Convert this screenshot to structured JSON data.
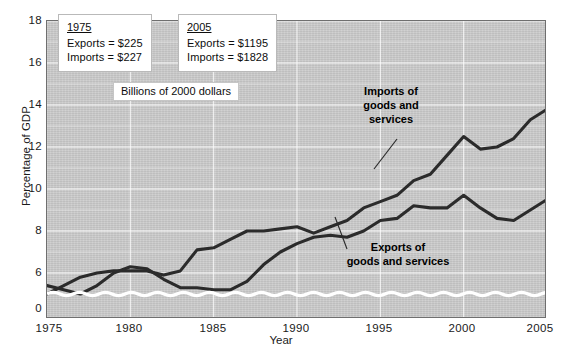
{
  "chart_data": {
    "type": "line",
    "title": "",
    "xlabel": "Year",
    "ylabel": "Percentage of GDP",
    "xlim": [
      1975,
      2005
    ],
    "ylim": [
      5.0,
      18.0
    ],
    "y_axis_break": true,
    "y_break_below": 5.0,
    "grid": true,
    "grid_color": "#ffffff",
    "plot_background": "#cdcdcd",
    "line_color": "#2b2b2b",
    "legend": "inline-annotations",
    "xticks": [
      "1975",
      "1980",
      "1985",
      "1990",
      "1995",
      "2000",
      "2005"
    ],
    "yticks": [
      "0",
      "6",
      "8",
      "10",
      "12",
      "14",
      "16",
      "18"
    ],
    "ytick_values": [
      0,
      6,
      8,
      10,
      12,
      14,
      16,
      18
    ],
    "x": [
      1975,
      1976,
      1977,
      1978,
      1979,
      1980,
      1981,
      1982,
      1983,
      1984,
      1985,
      1986,
      1987,
      1988,
      1989,
      1990,
      1991,
      1992,
      1993,
      1994,
      1995,
      1996,
      1997,
      1998,
      1999,
      2000,
      2001,
      2002,
      2003,
      2004,
      2005
    ],
    "series": [
      {
        "name": "Exports of goods and services",
        "values": [
          8.3,
          8.2,
          7.8,
          8.0,
          8.7,
          9.8,
          9.4,
          8.6,
          7.8,
          7.5,
          7.2,
          7.2,
          7.7,
          8.6,
          9.3,
          9.6,
          9.9,
          10.0,
          9.8,
          10.0,
          10.6,
          10.8,
          11.2,
          10.8,
          10.7,
          11.2,
          10.2,
          9.6,
          9.5,
          10.0,
          10.7
        ],
        "color": "#2b2b2b"
      },
      {
        "name": "Imports of goods and services",
        "values": [
          7.5,
          8.0,
          8.7,
          8.9,
          9.3,
          9.9,
          9.8,
          9.3,
          9.4,
          10.6,
          10.6,
          11.0,
          11.5,
          11.3,
          11.5,
          11.6,
          11.3,
          11.4,
          11.8,
          12.5,
          12.9,
          13.2,
          13.9,
          14.1,
          15.1,
          16.0,
          15.5,
          15.5,
          16.0,
          17.0,
          17.5
        ],
        "color": "#2b2b2b"
      }
    ],
    "series_plot": [
      {
        "name": "exports",
        "points": [
          [
            1975,
            5.4
          ],
          [
            1976,
            5.2
          ],
          [
            1977,
            5.0
          ],
          [
            1978,
            5.4
          ],
          [
            1979,
            6.0
          ],
          [
            1980,
            6.3
          ],
          [
            1981,
            6.2
          ],
          [
            1982,
            5.7
          ],
          [
            1983,
            5.3
          ],
          [
            1984,
            5.3
          ],
          [
            1985,
            5.2
          ],
          [
            1986,
            5.2
          ],
          [
            1987,
            5.6
          ],
          [
            1988,
            6.4
          ],
          [
            1989,
            7.0
          ],
          [
            1990,
            7.4
          ],
          [
            1991,
            7.7
          ],
          [
            1992,
            7.8
          ],
          [
            1993,
            7.7
          ],
          [
            1994,
            8.0
          ],
          [
            1995,
            8.5
          ],
          [
            1996,
            8.6
          ],
          [
            1997,
            9.2
          ],
          [
            1998,
            9.1
          ],
          [
            1999,
            9.1
          ],
          [
            2000,
            9.7
          ],
          [
            2001,
            9.1
          ],
          [
            2002,
            8.6
          ],
          [
            2003,
            8.5
          ],
          [
            2004,
            9.0
          ],
          [
            2005,
            9.5
          ]
        ]
      },
      {
        "name": "imports",
        "points": [
          [
            1975,
            5.0
          ],
          [
            1976,
            5.4
          ],
          [
            1977,
            5.8
          ],
          [
            1978,
            6.0
          ],
          [
            1979,
            6.1
          ],
          [
            1980,
            6.1
          ],
          [
            1981,
            6.1
          ],
          [
            1982,
            5.9
          ],
          [
            1983,
            6.1
          ],
          [
            1984,
            7.1
          ],
          [
            1985,
            7.2
          ],
          [
            1986,
            7.6
          ],
          [
            1987,
            8.0
          ],
          [
            1988,
            8.0
          ],
          [
            1989,
            8.1
          ],
          [
            1990,
            8.2
          ],
          [
            1991,
            7.9
          ],
          [
            1992,
            8.2
          ],
          [
            1993,
            8.5
          ],
          [
            1994,
            9.1
          ],
          [
            1995,
            9.4
          ],
          [
            1996,
            9.7
          ],
          [
            1997,
            10.4
          ],
          [
            1998,
            10.7
          ],
          [
            1999,
            11.6
          ],
          [
            2000,
            12.5
          ],
          [
            2001,
            11.9
          ],
          [
            2002,
            12.0
          ],
          [
            2003,
            12.4
          ],
          [
            2004,
            13.3
          ],
          [
            2005,
            13.8
          ]
        ]
      }
    ],
    "annotations": {
      "callout_1975": {
        "header": "1975",
        "lines": [
          "Exports  =  $225",
          "Imports  =  $227"
        ]
      },
      "callout_2005": {
        "header": "2005",
        "lines": [
          "Exports  =  $1195",
          "Imports  =  $1828"
        ]
      },
      "units_note": "Billions of 2000 dollars",
      "imports_label": [
        "Imports of",
        "goods and",
        "services"
      ],
      "exports_label": [
        "Exports of",
        "goods and services"
      ]
    }
  }
}
